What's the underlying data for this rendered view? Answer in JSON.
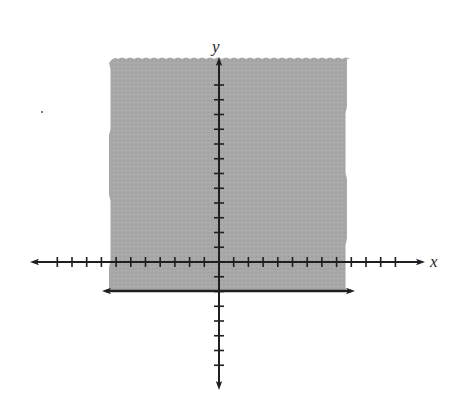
{
  "chart_data": {
    "type": "inequality_graph",
    "title": "",
    "inequality": "y >= -2",
    "xlabel": "x",
    "ylabel": "y",
    "boundary": {
      "kind": "horizontal_line",
      "y": -2,
      "style": "solid",
      "arrows_both_ends": true,
      "x_extent": [
        -8,
        9.3
      ]
    },
    "shaded_region": {
      "description": "above boundary line",
      "x_range": [
        -7.5,
        8.6
      ],
      "y_range": [
        -2,
        13.7
      ],
      "color": "#a6a6a6",
      "top_edge": "wavy"
    },
    "x_axis": {
      "tick_min": -11,
      "tick_max": 12,
      "tick_spacing_px": 14.7,
      "arrows_both_ends": true
    },
    "y_axis": {
      "tick_min": -7,
      "tick_max": 12,
      "tick_spacing_px": 14.75,
      "arrows_both_ends": true
    },
    "grid": false
  },
  "labels": {
    "x_axis": "x",
    "y_axis": "y"
  },
  "colors": {
    "shade": "#a6a6a6",
    "axis": "#1f1f1f",
    "background": "#ffffff"
  },
  "geometry": {
    "origin": [
      219,
      262
    ],
    "unit_px": 14.7,
    "x_axis_px": [
      30,
      425
    ],
    "y_axis_px": [
      57,
      390
    ],
    "boundary_px": {
      "y": 291,
      "x1": 102,
      "x2": 355
    },
    "shade_px": {
      "left": 110,
      "right": 346,
      "top": 59,
      "bottom": 291
    }
  }
}
